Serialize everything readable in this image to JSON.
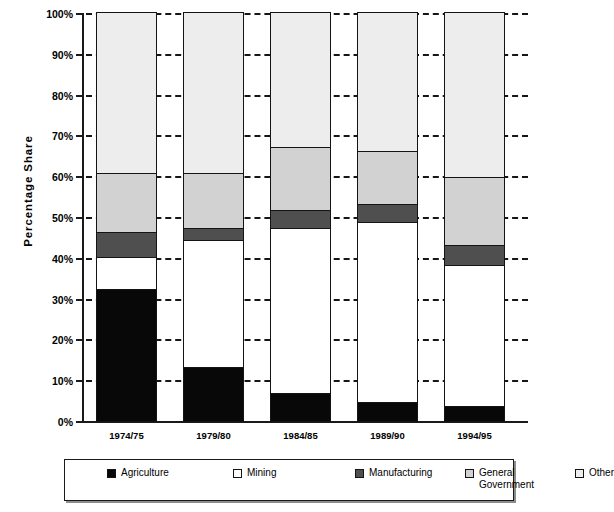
{
  "chart_data": {
    "type": "bar",
    "subtype": "stacked-percentage-column",
    "title": "",
    "xlabel": "",
    "ylabel": "Percentage  Share",
    "categories": [
      "1974/75",
      "1979/80",
      "1984/85",
      "1989/90",
      "1994/95"
    ],
    "ylim": [
      0,
      100
    ],
    "ytick_labels": [
      "0%",
      "10%",
      "20%",
      "30%",
      "40%",
      "50%",
      "60%",
      "70%",
      "80%",
      "90%",
      "100%"
    ],
    "ytick_values": [
      0,
      10,
      20,
      30,
      40,
      50,
      60,
      70,
      80,
      90,
      100
    ],
    "grid": true,
    "grid_style": "dashed-horizontal",
    "legend_position": "bottom",
    "series": [
      {
        "name": "Agriculture",
        "color": "#080808",
        "values": [
          32.0,
          13.0,
          6.5,
          4.5,
          3.5
        ]
      },
      {
        "name": "Mining",
        "color": "#ffffff",
        "values": [
          8.0,
          31.0,
          40.5,
          44.0,
          34.5
        ]
      },
      {
        "name": "Manufacturing",
        "color": "#4f4f4f",
        "values": [
          6.0,
          3.0,
          4.5,
          4.5,
          5.0
        ]
      },
      {
        "name": "General Government",
        "color": "#d2d2d2",
        "values": [
          14.5,
          13.5,
          15.5,
          13.0,
          16.5
        ]
      },
      {
        "name": "Other",
        "color": "#ededed",
        "values": [
          39.5,
          39.5,
          33.0,
          34.0,
          40.5
        ]
      }
    ],
    "cumulative_tops": {
      "1974/75": [
        32.0,
        40.0,
        46.0,
        60.5,
        100.0
      ],
      "1979/80": [
        13.0,
        44.0,
        47.0,
        60.5,
        100.0
      ],
      "1984/85": [
        6.5,
        47.0,
        51.5,
        67.0,
        100.0
      ],
      "1989/90": [
        4.5,
        48.5,
        53.0,
        66.0,
        100.0
      ],
      "1994/95": [
        3.5,
        38.0,
        43.0,
        59.5,
        100.0
      ]
    }
  },
  "axes": {
    "y_title": "Percentage  Share",
    "y_ticks": [
      {
        "label": "100%",
        "value": 100
      },
      {
        "label": "90%",
        "value": 90
      },
      {
        "label": "80%",
        "value": 80
      },
      {
        "label": "70%",
        "value": 70
      },
      {
        "label": "60%",
        "value": 60
      },
      {
        "label": "50%",
        "value": 50
      },
      {
        "label": "40%",
        "value": 40
      },
      {
        "label": "30%",
        "value": 30
      },
      {
        "label": "20%",
        "value": 20
      },
      {
        "label": "10%",
        "value": 10
      },
      {
        "label": "0%",
        "value": 0
      }
    ],
    "x_ticks": [
      {
        "label": "1974/75"
      },
      {
        "label": "1979/80"
      },
      {
        "label": "1984/85"
      },
      {
        "label": "1989/90"
      },
      {
        "label": "1994/95"
      }
    ]
  },
  "legend": {
    "items": [
      {
        "label": "Agriculture",
        "color": "#080808"
      },
      {
        "label": "Mining",
        "color": "#ffffff"
      },
      {
        "label": "Manufacturing",
        "color": "#4f4f4f"
      },
      {
        "label": "General\nGovernment",
        "color": "#d2d2d2"
      },
      {
        "label": "Other",
        "color": "#ededed"
      }
    ]
  }
}
